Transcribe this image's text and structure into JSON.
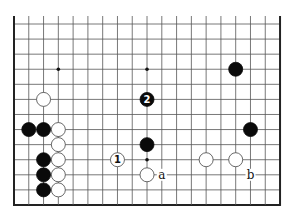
{
  "board": {
    "columns": 19,
    "rows": 13,
    "origin_x": 14,
    "origin_y": 24,
    "spacing_x": 14.78,
    "spacing_y": 15.08,
    "top_extension": 8,
    "edges": {
      "left": true,
      "right": true,
      "bottom": true,
      "top": false
    },
    "line_color": "#555555",
    "edge_color": "#222222"
  },
  "star_points": [
    {
      "col": 3,
      "row": 3
    },
    {
      "col": 9,
      "row": 3
    },
    {
      "col": 9,
      "row": 9
    }
  ],
  "stones": [
    {
      "color": "white",
      "col": 2,
      "row": 5
    },
    {
      "color": "black",
      "col": 1,
      "row": 7
    },
    {
      "color": "black",
      "col": 2,
      "row": 7
    },
    {
      "color": "white",
      "col": 3,
      "row": 7
    },
    {
      "color": "white",
      "col": 3,
      "row": 8
    },
    {
      "color": "white",
      "col": 3,
      "row": 9
    },
    {
      "color": "white",
      "col": 3,
      "row": 10
    },
    {
      "color": "white",
      "col": 3,
      "row": 11
    },
    {
      "color": "black",
      "col": 2,
      "row": 9
    },
    {
      "color": "black",
      "col": 2,
      "row": 10
    },
    {
      "color": "black",
      "col": 2,
      "row": 11
    },
    {
      "color": "white",
      "col": 7,
      "row": 9,
      "label": "1"
    },
    {
      "color": "black",
      "col": 9,
      "row": 5,
      "label": "2"
    },
    {
      "color": "black",
      "col": 9,
      "row": 8
    },
    {
      "color": "white",
      "col": 9,
      "row": 10
    },
    {
      "color": "black",
      "col": 15,
      "row": 3
    },
    {
      "color": "black",
      "col": 16,
      "row": 7
    },
    {
      "color": "white",
      "col": 13,
      "row": 9
    },
    {
      "color": "white",
      "col": 15,
      "row": 9
    }
  ],
  "labels": [
    {
      "text": "a",
      "col": 10,
      "row": 10
    },
    {
      "text": "b",
      "col": 16,
      "row": 10
    }
  ]
}
